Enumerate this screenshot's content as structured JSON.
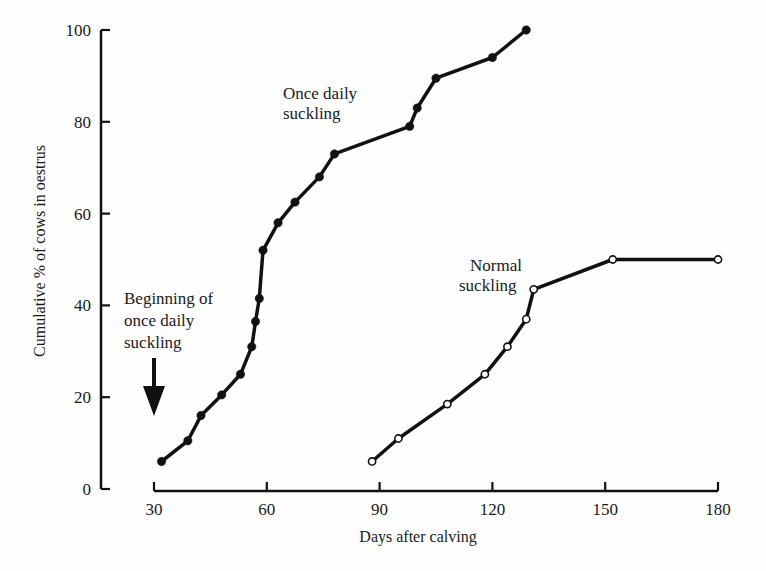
{
  "chart_data": {
    "type": "line",
    "title": "",
    "xlabel": "Days after calving",
    "ylabel": "Cumulative % of cows in oestrus",
    "xlim": [
      30,
      180
    ],
    "ylim": [
      0,
      100
    ],
    "xticks": [
      30,
      60,
      90,
      120,
      150,
      180
    ],
    "yticks": [
      0,
      20,
      40,
      60,
      80,
      100
    ],
    "grid": false,
    "legend": "none (series labelled inline)",
    "series": [
      {
        "name": "Once daily suckling",
        "marker": "filled-circle",
        "label_lines": [
          "Once daily",
          "suckling"
        ],
        "x": [
          32,
          39,
          42.5,
          48,
          53,
          56,
          57,
          58,
          59,
          63,
          67.5,
          74,
          78,
          98,
          100,
          105,
          120,
          129
        ],
        "y": [
          6,
          10.5,
          16,
          20.5,
          25,
          31,
          36.5,
          41.5,
          52,
          58,
          62.5,
          68,
          73,
          79,
          83,
          89.5,
          94,
          100
        ]
      },
      {
        "name": "Normal suckling",
        "marker": "open-circle",
        "label_lines": [
          "Normal",
          "suckling"
        ],
        "x": [
          88,
          95,
          108,
          118,
          124,
          129,
          131,
          152,
          180
        ],
        "y": [
          6,
          11,
          18.5,
          25,
          31,
          37,
          43.5,
          50,
          50
        ]
      }
    ],
    "annotations": [
      {
        "text_lines": [
          "Beginning of",
          "once daily",
          "suckling"
        ],
        "arrow": "down",
        "x": 30
      }
    ]
  }
}
